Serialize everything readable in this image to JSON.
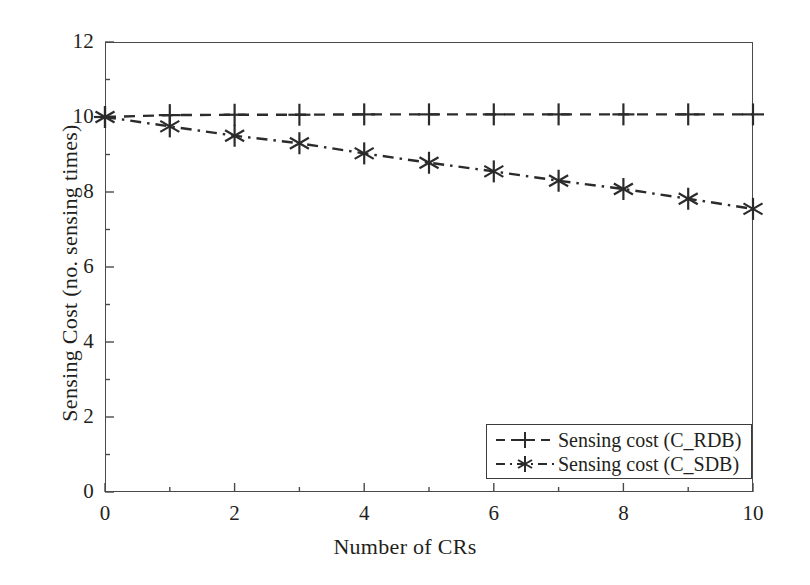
{
  "chart_data": {
    "type": "line",
    "title": "",
    "xlabel": "Number of CRs",
    "ylabel": "Sensing Cost (no. sensing times)",
    "xlim": [
      0,
      10
    ],
    "ylim": [
      0,
      12
    ],
    "xticks": [
      0,
      2,
      4,
      6,
      8,
      10
    ],
    "xticks_labels": [
      "0",
      "2",
      "4",
      "6",
      "8",
      "10"
    ],
    "xminor_ticks": [
      1,
      3,
      5,
      7,
      9
    ],
    "yticks": [
      0,
      2,
      4,
      6,
      8,
      10,
      12
    ],
    "yticks_labels": [
      "0",
      "2",
      "4",
      "6",
      "8",
      "10",
      "12"
    ],
    "grid": false,
    "legend_position": "lower right",
    "x": [
      0,
      1,
      2,
      3,
      4,
      5,
      6,
      7,
      8,
      9,
      10
    ],
    "series": [
      {
        "name": "Sensing cost (C_RDB)",
        "marker": "plus",
        "linestyle": "dashed",
        "color": "#2b2b2b",
        "values": [
          10.0,
          10.05,
          10.06,
          10.06,
          10.07,
          10.07,
          10.07,
          10.07,
          10.07,
          10.07,
          10.07
        ]
      },
      {
        "name": "Sensing cost (C_SDB)",
        "marker": "asterisk",
        "linestyle": "dashdot",
        "color": "#2b2b2b",
        "values": [
          10.0,
          9.75,
          9.5,
          9.3,
          9.03,
          8.78,
          8.55,
          8.3,
          8.08,
          7.82,
          7.55
        ]
      }
    ]
  },
  "legend": {
    "items": [
      {
        "label": "Sensing cost (C_RDB)",
        "marker": "plus",
        "linestyle": "dashed"
      },
      {
        "label": "Sensing cost (C_SDB)",
        "marker": "asterisk",
        "linestyle": "dashdot"
      }
    ]
  },
  "colors": {
    "axis": "#4a4a4a",
    "ink": "#231f20",
    "series": "#2b2b2b",
    "background": "#ffffff"
  }
}
